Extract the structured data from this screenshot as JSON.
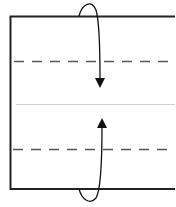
{
  "diagram": {
    "type": "origami-fold-diagram",
    "colors": {
      "background": "#ffffff",
      "border": "#222222",
      "fold_line": "#555555",
      "center_line": "#cccccc",
      "arrow": "#111111"
    },
    "elements": {
      "paper": {
        "x": 10,
        "y": 16,
        "right_edge": "open",
        "bottom": 189
      },
      "fold_lines": [
        {
          "name": "top-valley-fold",
          "y": 61,
          "style": "dashed"
        },
        {
          "name": "bottom-valley-fold",
          "y": 149,
          "style": "dashed"
        }
      ],
      "center_line": {
        "y": 104
      },
      "arrows": [
        {
          "name": "top-fold-arrow",
          "direction": "down",
          "tip": [
            100,
            87
          ]
        },
        {
          "name": "bottom-fold-arrow",
          "direction": "up",
          "tip": [
            102,
            118
          ]
        }
      ]
    }
  }
}
